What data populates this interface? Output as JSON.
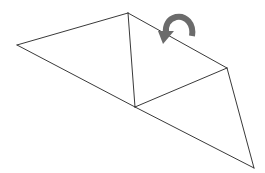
{
  "diagram": {
    "stroke_color": "#222222",
    "arrow_color": "#6b6b6b",
    "background": "#ffffff",
    "vertices": {
      "A": [
        17,
        45
      ],
      "B": [
        128,
        13
      ],
      "C": [
        227,
        68
      ],
      "D": [
        135,
        107
      ],
      "E": [
        254,
        168
      ]
    },
    "edges": [
      [
        "A",
        "B"
      ],
      [
        "B",
        "C"
      ],
      [
        "A",
        "D"
      ],
      [
        "D",
        "E"
      ],
      [
        "B",
        "D"
      ],
      [
        "D",
        "C"
      ],
      [
        "C",
        "E"
      ]
    ],
    "arrow": {
      "type": "curved-fold-arrow",
      "direction": "counter-clockwise, pointing down-left"
    }
  }
}
